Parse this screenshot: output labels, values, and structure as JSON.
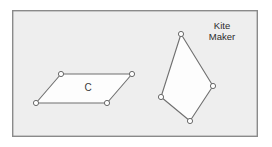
{
  "figure": {
    "background_color": "#ffffff",
    "panel": {
      "fill_color": "#eeeeee",
      "border_color": "#8a8a8a",
      "x": 12,
      "y": 10,
      "width": 246,
      "height": 127
    },
    "shapes": [
      {
        "id": "parallelogram",
        "name": "parallelogram",
        "label": "C",
        "label_x": 88,
        "label_y": 88,
        "fill_color": "#fdfdfd",
        "stroke_color": "#6f6f6f",
        "points": "61,74 132,74 107,103 36,103",
        "vertices": [
          {
            "x": 61,
            "y": 74
          },
          {
            "x": 132,
            "y": 74
          },
          {
            "x": 107,
            "y": 103
          },
          {
            "x": 36,
            "y": 103
          }
        ]
      },
      {
        "id": "kite",
        "name": "kite",
        "label": "",
        "fill_color": "#fdfdfd",
        "stroke_color": "#6f6f6f",
        "points": "181,34 213,86 190,121 161,97",
        "vertices": [
          {
            "x": 181,
            "y": 34
          },
          {
            "x": 213,
            "y": 86
          },
          {
            "x": 190,
            "y": 121
          },
          {
            "x": 161,
            "y": 97
          }
        ]
      }
    ],
    "captions": [
      {
        "id": "kite-maker-caption",
        "lines": [
          "Kite",
          "Maker"
        ],
        "x": 222,
        "y": 29,
        "line_height": 11
      }
    ],
    "vertex_marker": {
      "radius": 2.6,
      "fill_color": "#ffffff",
      "stroke_color": "#6a6a6a"
    }
  }
}
